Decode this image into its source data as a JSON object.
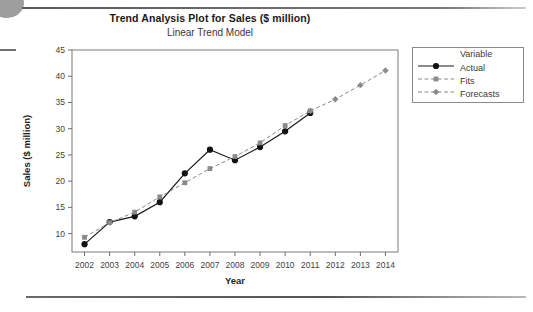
{
  "chart_data": {
    "type": "line",
    "title": "Trend Analysis Plot for Sales ($ million)",
    "subtitle": "Linear Trend Model",
    "xlabel": "Year",
    "ylabel": "Sales ($ million)",
    "x": [
      2002,
      2003,
      2004,
      2005,
      2006,
      2007,
      2008,
      2009,
      2010,
      2011,
      2012,
      2013,
      2014
    ],
    "xticklabels": [
      "2002",
      "2003",
      "2004",
      "2005",
      "2006",
      "2007",
      "2008",
      "2009",
      "2010",
      "2011",
      "2012",
      "2013",
      "2014"
    ],
    "yticks": [
      10,
      15,
      20,
      25,
      30,
      35,
      40,
      45
    ],
    "ylim": [
      6.5,
      45
    ],
    "xlim": [
      2001.5,
      2014.5
    ],
    "grid": false,
    "legend_position": "right-outside",
    "legend_title": "Variable",
    "series": [
      {
        "name": "Actual",
        "style": "solid",
        "marker": "circle",
        "color": "#111111",
        "x": [
          2002,
          2003,
          2004,
          2005,
          2006,
          2007,
          2008,
          2009,
          2010,
          2011
        ],
        "values": [
          8.0,
          12.2,
          13.3,
          16.0,
          21.5,
          26.0,
          24.0,
          26.5,
          29.5,
          33.0
        ]
      },
      {
        "name": "Fits",
        "style": "dashed",
        "marker": "square",
        "color": "#8a8a8a",
        "x": [
          2002,
          2003,
          2004,
          2005,
          2006,
          2007,
          2008,
          2009,
          2010,
          2011
        ],
        "values": [
          9.3,
          12.1,
          14.1,
          17.0,
          19.7,
          22.4,
          24.7,
          27.3,
          30.6,
          33.4
        ]
      },
      {
        "name": "Forecasts",
        "style": "dashed",
        "marker": "diamond",
        "color": "#8a8a8a",
        "x": [
          2011,
          2012,
          2013,
          2014
        ],
        "values": [
          33.4,
          35.6,
          38.3,
          41.1
        ]
      }
    ]
  },
  "legend": {
    "title": "Variable",
    "entries": [
      {
        "label": "Actual"
      },
      {
        "label": "Fits"
      },
      {
        "label": "Forecasts"
      }
    ]
  }
}
